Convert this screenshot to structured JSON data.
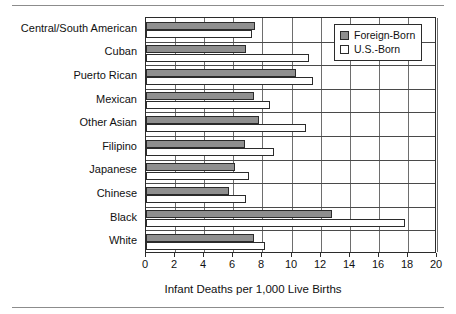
{
  "figure": {
    "has_top_rule": true,
    "has_bottom_rule": true,
    "frame_color": "#2b2b2b",
    "rule_color": "#8c8c8c"
  },
  "legend": {
    "position": "top-right",
    "entries": [
      {
        "label": "Foreign-Born",
        "color": "#8f8f8f",
        "swatch": "filled-gray-square-icon"
      },
      {
        "label": "U.S.-Born",
        "color": "#ffffff",
        "swatch": "empty-white-square-icon"
      }
    ]
  },
  "chart_data": {
    "type": "bar",
    "orientation": "horizontal",
    "title": "",
    "xlabel": "Infant Deaths per 1,000 Live Births",
    "ylabel": "",
    "xlim": [
      0,
      20
    ],
    "xticks": [
      0,
      2,
      4,
      6,
      8,
      10,
      12,
      14,
      16,
      18,
      20
    ],
    "xticklabels": [
      "0",
      "2",
      "4",
      "6",
      "8",
      "10",
      "12",
      "14",
      "16",
      "18",
      "20"
    ],
    "grid": true,
    "grid_axis": "x",
    "legend_position": "upper right",
    "categories": [
      "Central/South American",
      "Cuban",
      "Puerto Rican",
      "Mexican",
      "Other Asian",
      "Filipino",
      "Japanese",
      "Chinese",
      "Black",
      "White"
    ],
    "series": [
      {
        "name": "Foreign-Born",
        "color": "#8f8f8f",
        "values": [
          7.5,
          6.9,
          10.3,
          7.4,
          7.8,
          6.8,
          6.1,
          5.7,
          12.8,
          7.4
        ]
      },
      {
        "name": "U.S.-Born",
        "color": "#ffffff",
        "values": [
          7.3,
          11.2,
          11.5,
          8.5,
          11.0,
          8.8,
          7.1,
          6.9,
          17.8,
          8.2
        ]
      }
    ]
  }
}
